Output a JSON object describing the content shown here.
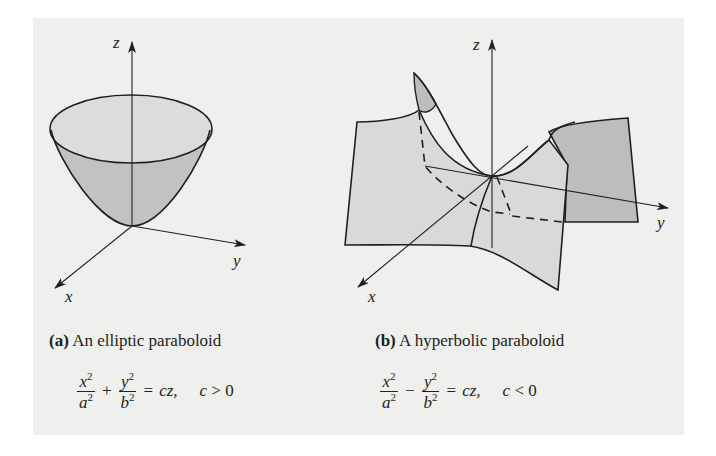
{
  "figure": {
    "background_color": "#efefed",
    "surface_fill_light": "#d9d9d7",
    "surface_fill_dark": "#bdbdbb",
    "line_color": "#231f20"
  },
  "panels": [
    {
      "id": "a",
      "axes": {
        "z": "z",
        "y": "y",
        "x": "x"
      },
      "caption_tag": "(a)",
      "caption_text": "An elliptic paraboloid",
      "equation": {
        "term1_num": "x",
        "term1_den": "a",
        "exp": "2",
        "operator": "+",
        "term2_num": "y",
        "term2_den": "b",
        "equals": "=",
        "rhs": "cz,",
        "condition_var": "c",
        "condition_rest": " > 0"
      }
    },
    {
      "id": "b",
      "axes": {
        "z": "z",
        "y": "y",
        "x": "x"
      },
      "caption_tag": "(b)",
      "caption_text": "A hyperbolic paraboloid",
      "equation": {
        "term1_num": "x",
        "term1_den": "a",
        "exp": "2",
        "operator": "−",
        "term2_num": "y",
        "term2_den": "b",
        "equals": "=",
        "rhs": "cz,",
        "condition_var": "c",
        "condition_rest": " < 0"
      }
    }
  ]
}
